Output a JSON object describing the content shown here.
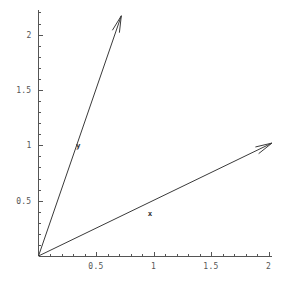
{
  "chart_data": {
    "type": "scatter",
    "title": "",
    "xlabel": "",
    "ylabel": "",
    "xlim": [
      0,
      2.1
    ],
    "ylim": [
      0,
      2.25
    ],
    "grid": false,
    "legend": "none",
    "background_color": "#ffffff",
    "axis_color": "#555555",
    "vector_color": "#3a3a3a",
    "x_ticks": [
      {
        "value": 0.5,
        "label": "0.5"
      },
      {
        "value": 1,
        "label": "1"
      },
      {
        "value": 1.5,
        "label": "1.5"
      },
      {
        "value": 2,
        "label": "2"
      }
    ],
    "y_ticks": [
      {
        "value": 0.5,
        "label": "0.5"
      },
      {
        "value": 1,
        "label": "1"
      },
      {
        "value": 1.5,
        "label": "1.5"
      },
      {
        "value": 2,
        "label": "2"
      }
    ],
    "x_minor_tick_step": 0.1,
    "y_minor_tick_step": 0.1,
    "vectors": [
      {
        "name": "x",
        "label": "x",
        "start": [
          0,
          0
        ],
        "end": [
          2.03,
          1.02
        ],
        "label_position": [
          0.97,
          0.39
        ]
      },
      {
        "name": "y",
        "label": "y",
        "start": [
          0,
          0
        ],
        "end": [
          0.72,
          2.17
        ],
        "label_position": [
          0.345,
          1.0
        ]
      }
    ]
  }
}
